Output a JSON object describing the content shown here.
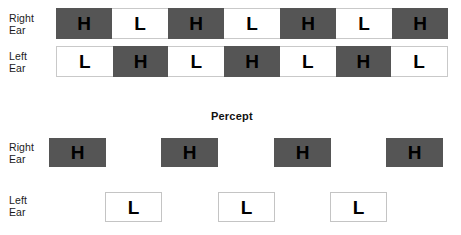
{
  "figure": {
    "background_color": "#ffffff",
    "block_dark_color": "#555555",
    "block_light_color": "#ffffff",
    "block_border_color": "#c4c4c4",
    "text_color": "#000000"
  },
  "stimulus": {
    "right_ear": {
      "label_line1": "Right",
      "label_line2": "Ear",
      "cells": [
        {
          "text": "H",
          "tone": "dark"
        },
        {
          "text": "L",
          "tone": "light"
        },
        {
          "text": "H",
          "tone": "dark"
        },
        {
          "text": "L",
          "tone": "light"
        },
        {
          "text": "H",
          "tone": "dark"
        },
        {
          "text": "L",
          "tone": "light"
        },
        {
          "text": "H",
          "tone": "dark"
        }
      ]
    },
    "left_ear": {
      "label_line1": "Left",
      "label_line2": "Ear",
      "cells": [
        {
          "text": "L",
          "tone": "light"
        },
        {
          "text": "H",
          "tone": "dark"
        },
        {
          "text": "L",
          "tone": "light"
        },
        {
          "text": "H",
          "tone": "dark"
        },
        {
          "text": "L",
          "tone": "light"
        },
        {
          "text": "H",
          "tone": "dark"
        },
        {
          "text": "L",
          "tone": "light"
        }
      ]
    }
  },
  "percept": {
    "title": "Percept",
    "right_ear": {
      "label_line1": "Right",
      "label_line2": "Ear",
      "blocks": [
        {
          "text": "H",
          "tone": "dark"
        },
        {
          "text": "H",
          "tone": "dark"
        },
        {
          "text": "H",
          "tone": "dark"
        },
        {
          "text": "H",
          "tone": "dark"
        }
      ]
    },
    "left_ear": {
      "label_line1": "Left",
      "label_line2": "Ear",
      "blocks": [
        {
          "text": "L",
          "tone": "light"
        },
        {
          "text": "L",
          "tone": "light"
        },
        {
          "text": "L",
          "tone": "light"
        }
      ]
    }
  }
}
